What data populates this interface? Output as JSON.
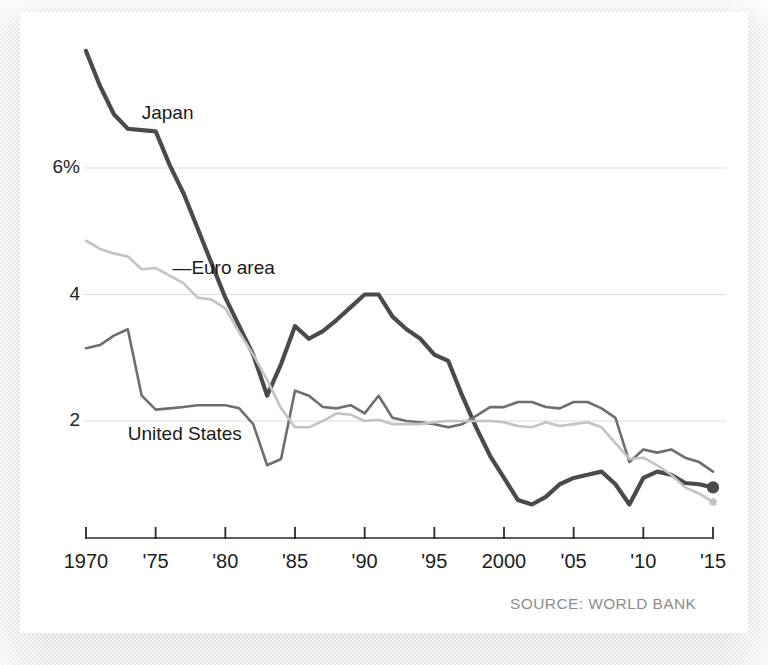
{
  "figure": {
    "source_note": "SOURCE: WORLD BANK",
    "background_color": "#ffffff",
    "border_texture_color": "#d9d9d9"
  },
  "chart_data": {
    "type": "line",
    "title": "",
    "subtitle": "",
    "xlabel": "",
    "ylabel": "",
    "xlim": [
      1970,
      2015
    ],
    "ylim": [
      0,
      8.25
    ],
    "grid": "horizontal",
    "legend_position": "inline-annotations",
    "x_tick_values": [
      1970,
      1975,
      1980,
      1985,
      1990,
      1995,
      2000,
      2005,
      2010,
      2015
    ],
    "x_tick_labels": [
      "1970",
      "'75",
      "'80",
      "'85",
      "'90",
      "'95",
      "2000",
      "'05",
      "'10",
      "'15"
    ],
    "y_tick_values": [
      2,
      4,
      6
    ],
    "y_tick_labels": [
      "2",
      "4",
      "6%"
    ],
    "x": [
      1970,
      1971,
      1972,
      1973,
      1974,
      1975,
      1976,
      1977,
      1978,
      1979,
      1980,
      1981,
      1982,
      1983,
      1984,
      1985,
      1986,
      1987,
      1988,
      1989,
      1990,
      1991,
      1992,
      1993,
      1994,
      1995,
      1996,
      1997,
      1998,
      1999,
      2000,
      2001,
      2002,
      2003,
      2004,
      2005,
      2006,
      2007,
      2008,
      2009,
      2010,
      2011,
      2012,
      2013,
      2014,
      2015
    ],
    "series": [
      {
        "name": "Japan",
        "color": "#4a4a4a",
        "width": 4.2,
        "end_marker": true,
        "label_x": 1974.0,
        "label_y": 6.85,
        "values": [
          7.85,
          7.3,
          6.85,
          6.62,
          6.6,
          6.58,
          6.05,
          5.6,
          5.05,
          4.5,
          3.95,
          3.5,
          3.05,
          2.4,
          2.9,
          3.5,
          3.3,
          3.42,
          3.6,
          3.8,
          4.0,
          4.0,
          3.65,
          3.45,
          3.3,
          3.05,
          2.95,
          2.4,
          1.9,
          1.45,
          1.1,
          0.75,
          0.68,
          0.8,
          1.0,
          1.1,
          1.15,
          1.2,
          1.0,
          0.68,
          1.1,
          1.2,
          1.15,
          1.02,
          1.0,
          0.95
        ]
      },
      {
        "name": "United States",
        "color": "#6e6e6e",
        "width": 2.6,
        "end_marker": false,
        "label_x": 1973.0,
        "label_y": 1.78,
        "values": [
          3.15,
          3.2,
          3.35,
          3.45,
          2.4,
          2.18,
          2.2,
          2.22,
          2.25,
          2.25,
          2.25,
          2.2,
          1.95,
          1.3,
          1.4,
          2.48,
          2.4,
          2.22,
          2.2,
          2.25,
          2.12,
          2.4,
          2.05,
          2.0,
          1.98,
          1.95,
          1.9,
          1.95,
          2.08,
          2.22,
          2.22,
          2.3,
          2.3,
          2.22,
          2.2,
          2.3,
          2.3,
          2.2,
          2.05,
          1.35,
          1.55,
          1.5,
          1.55,
          1.42,
          1.35,
          1.2
        ]
      },
      {
        "name": "Euro area",
        "color": "#c3c3c3",
        "width": 2.6,
        "end_marker": true,
        "label_x": 1976.2,
        "label_y": 4.4,
        "values": [
          4.85,
          4.72,
          4.65,
          4.6,
          4.4,
          4.42,
          4.3,
          4.18,
          3.95,
          3.92,
          3.78,
          3.4,
          3.05,
          2.65,
          2.2,
          1.9,
          1.9,
          2.0,
          2.12,
          2.1,
          2.0,
          2.02,
          1.95,
          1.95,
          1.95,
          1.98,
          2.0,
          2.0,
          2.0,
          2.0,
          1.98,
          1.92,
          1.9,
          1.98,
          1.92,
          1.95,
          1.98,
          1.9,
          1.65,
          1.4,
          1.42,
          1.3,
          1.15,
          0.95,
          0.85,
          0.72
        ]
      }
    ],
    "annotations": [
      {
        "text": "Japan",
        "leader": false
      },
      {
        "text": "—Euro area",
        "leader": true
      },
      {
        "text": "United States",
        "leader": false
      }
    ]
  }
}
